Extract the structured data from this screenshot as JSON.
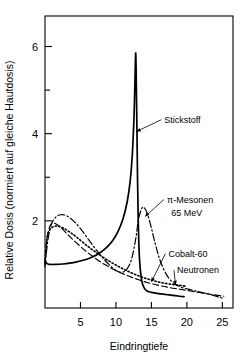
{
  "chart_data": {
    "type": "line",
    "title": "",
    "xlabel": "Eindringtiefe",
    "ylabel": "Relative Dosis (normiert auf gleiche Hautdosis)",
    "xlim": [
      0,
      26.5
    ],
    "ylim": [
      0,
      6.7
    ],
    "grid": false,
    "legend_position": "inline-annotations",
    "x_ticks": [
      5,
      10,
      15,
      20,
      25
    ],
    "x_tick_labels": [
      "5",
      "10",
      "15",
      "20",
      "25"
    ],
    "y_ticks": [
      2,
      4,
      6
    ],
    "y_tick_labels": [
      "2",
      "4",
      "6"
    ],
    "y_minor_ticks": [
      3,
      5
    ],
    "series": [
      {
        "name": "Stickstoff",
        "style": "solid",
        "label": "Stickstoff",
        "peak_x": 12.8,
        "peak_y": 5.85,
        "x": [
          0.0,
          0.3,
          0.8,
          1.5,
          2.5,
          3.5,
          4.5,
          5.5,
          6.5,
          7.5,
          8.5,
          9.5,
          10.3,
          11.0,
          11.6,
          12.0,
          12.3,
          12.55,
          12.7,
          12.78,
          12.85,
          12.95,
          13.05,
          13.15,
          13.3,
          13.5,
          13.8,
          14.3,
          15.0,
          16.0,
          17.0,
          18.0,
          19.0,
          19.6
        ],
        "y": [
          1.1,
          1.02,
          1.0,
          1.0,
          1.01,
          1.03,
          1.06,
          1.1,
          1.16,
          1.24,
          1.36,
          1.54,
          1.76,
          2.05,
          2.45,
          2.9,
          3.5,
          4.4,
          5.35,
          5.85,
          5.4,
          4.2,
          2.9,
          1.95,
          1.2,
          0.78,
          0.52,
          0.4,
          0.36,
          0.33,
          0.31,
          0.29,
          0.27,
          0.26
        ]
      },
      {
        "name": "pi-Mesonen 65 MeV",
        "style": "dash-dot",
        "label": "π-Mesonen",
        "label_line2": "65 MeV",
        "peak_x": 13.7,
        "peak_y": 2.3,
        "x": [
          0.0,
          0.4,
          0.9,
          1.5,
          2.2,
          3.0,
          4.0,
          5.0,
          6.0,
          7.0,
          8.0,
          9.0,
          10.0,
          10.8,
          11.5,
          12.2,
          12.8,
          13.2,
          13.7,
          14.2,
          14.8,
          15.5,
          16.2,
          17.0,
          17.8,
          18.6,
          19.5,
          20.5,
          21.5,
          22.5,
          23.5,
          24.5,
          25.2
        ],
        "y": [
          0.95,
          1.55,
          1.92,
          2.08,
          2.14,
          2.12,
          2.0,
          1.82,
          1.6,
          1.38,
          1.18,
          1.0,
          0.86,
          0.82,
          0.88,
          1.12,
          1.6,
          2.05,
          2.3,
          2.25,
          1.96,
          1.5,
          1.1,
          0.8,
          0.62,
          0.52,
          0.46,
          0.42,
          0.38,
          0.34,
          0.3,
          0.25,
          0.22
        ]
      },
      {
        "name": "Cobalt-60",
        "style": "dashed",
        "label": "Cobalt-60",
        "peak_x": 1.2,
        "peak_y": 1.95,
        "x": [
          0.0,
          0.3,
          0.7,
          1.2,
          2.0,
          3.0,
          4.0,
          5.5,
          7.0,
          8.5,
          10.0,
          11.5,
          13.0,
          14.5,
          16.0,
          17.5,
          19.0,
          20.5,
          22.0,
          23.5,
          25.2
        ],
        "y": [
          1.0,
          1.6,
          1.88,
          1.95,
          1.88,
          1.72,
          1.56,
          1.34,
          1.15,
          0.99,
          0.86,
          0.75,
          0.66,
          0.58,
          0.52,
          0.47,
          0.43,
          0.39,
          0.35,
          0.31,
          0.27
        ]
      },
      {
        "name": "Neutronen",
        "style": "dotted",
        "label": "Neutronen",
        "peak_x": 1.6,
        "peak_y": 1.88,
        "x": [
          0.0,
          0.3,
          0.8,
          1.6,
          2.5,
          3.5,
          4.5,
          6.0,
          7.5,
          9.0,
          10.5,
          12.0,
          13.5,
          15.0,
          16.5,
          18.0,
          19.0,
          19.8
        ],
        "y": [
          1.05,
          1.62,
          1.82,
          1.88,
          1.84,
          1.74,
          1.62,
          1.42,
          1.24,
          1.08,
          0.94,
          0.82,
          0.72,
          0.64,
          0.58,
          0.54,
          0.52,
          0.5
        ]
      }
    ],
    "annotations": [
      {
        "text": "Stickstoff",
        "x": 16.8,
        "y": 4.25,
        "target_x": 12.9,
        "target_y": 4.05
      },
      {
        "text": "π-Mesonen",
        "x": 17.2,
        "y": 2.42,
        "target_x": 14.1,
        "target_y": 2.1
      },
      {
        "text": "65 MeV",
        "x": 17.8,
        "y": 2.12,
        "target_x": null,
        "target_y": null
      },
      {
        "text": "Cobalt-60",
        "x": 17.4,
        "y": 1.18,
        "target_x": 15.0,
        "target_y": 0.6
      },
      {
        "text": "Neutronen",
        "x": 18.6,
        "y": 0.8,
        "target_x": 18.4,
        "target_y": 0.53
      }
    ]
  },
  "axes": {
    "x_title": "Eindringtiefe",
    "y_title": "Relative Dosis (normiert auf gleiche Hautdosis)"
  }
}
